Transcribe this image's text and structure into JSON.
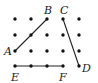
{
  "diagram": {
    "type": "dot-grid-segments",
    "grid": {
      "columns": 5,
      "rows": 4,
      "x": [
        15,
        31,
        47,
        63,
        79
      ],
      "y": [
        19,
        35,
        51,
        66
      ],
      "dot_color": "#111111"
    },
    "points": {
      "A": {
        "label": "A",
        "x": 15,
        "y": 51,
        "lx": 4,
        "ly": 55
      },
      "B": {
        "label": "B",
        "x": 47,
        "y": 19,
        "lx": 44,
        "ly": 14
      },
      "C": {
        "label": "C",
        "x": 63,
        "y": 19,
        "lx": 60,
        "ly": 14
      },
      "D": {
        "label": "D",
        "x": 79,
        "y": 66,
        "lx": 82,
        "ly": 72
      },
      "E": {
        "label": "E",
        "x": 15,
        "y": 66,
        "lx": 11,
        "ly": 81
      },
      "F": {
        "label": "F",
        "x": 63,
        "y": 66,
        "lx": 59,
        "ly": 81
      }
    },
    "segments": [
      {
        "name": "AB",
        "from": "A",
        "to": "B"
      },
      {
        "name": "CD",
        "from": "C",
        "to": "D"
      },
      {
        "name": "EF",
        "from": "E",
        "to": "F"
      }
    ],
    "line_color": "#222222"
  }
}
